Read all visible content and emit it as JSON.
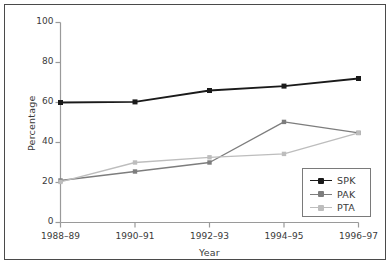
{
  "chart_data": {
    "type": "line",
    "title": "",
    "xlabel": "Year",
    "ylabel": "Percentage",
    "categories": [
      "1988–89",
      "1990–91",
      "1992–93",
      "1994–95",
      "1996–97"
    ],
    "xtick_labels": [
      "1988–89",
      "1990–91",
      "1992–93",
      "1994–95",
      "1996–97"
    ],
    "ytick_labels": [
      "0",
      "20",
      "40",
      "60",
      "80",
      "100"
    ],
    "yticks": [
      0,
      20,
      40,
      60,
      80,
      100
    ],
    "ylim": [
      0,
      100
    ],
    "xlim": [
      0,
      4
    ],
    "grid": false,
    "legend_position": "lower right",
    "series": [
      {
        "name": "SPK",
        "color": "#1a1a1a",
        "marker": "square",
        "values": [
          60.0,
          60.3,
          66.0,
          68.2,
          72.0
        ]
      },
      {
        "name": "PAK",
        "color": "#7d7d7d",
        "marker": "square",
        "values": [
          21.0,
          25.5,
          30.0,
          50.3,
          44.8
        ]
      },
      {
        "name": "PTA",
        "color": "#bdbdbd",
        "marker": "square",
        "values": [
          20.3,
          30.0,
          32.6,
          34.3,
          44.8
        ]
      }
    ]
  },
  "figure": {
    "background_color": "#ffffff",
    "frame_color": "#4a4a4a",
    "axis_color": "#9a9a9a",
    "text_color": "#3a3a3a"
  }
}
